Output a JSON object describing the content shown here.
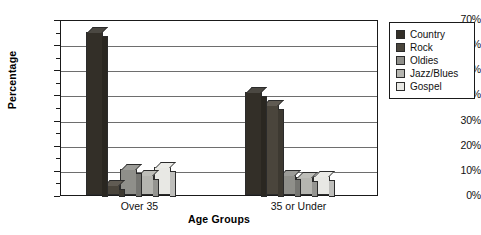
{
  "chart_data": {
    "type": "bar",
    "title": "",
    "xlabel": "Age Groups",
    "ylabel": "Percentage",
    "categories": [
      "Over 35",
      "35 or Under"
    ],
    "series": [
      {
        "name": "Country",
        "values": [
          65,
          41
        ],
        "color": "#332f28"
      },
      {
        "name": "Rock",
        "values": [
          4,
          36
        ],
        "color": "#4a453c"
      },
      {
        "name": "Oldies",
        "values": [
          10.5,
          8
        ],
        "color": "#8f8f8a"
      },
      {
        "name": "Jazz/Blues",
        "values": [
          8,
          7
        ],
        "color": "#b5b5b0"
      },
      {
        "name": "Gospel",
        "values": [
          11,
          7.5
        ],
        "color": "#e8e8e4"
      }
    ],
    "ylim": [
      0,
      70
    ],
    "ytick_labels": [
      "0%",
      "10%",
      "20%",
      "30%",
      "40%",
      "50%",
      "60%",
      "70%"
    ],
    "ytick_values": [
      0,
      10,
      20,
      30,
      40,
      50,
      60,
      70
    ],
    "yminor_values": [
      5,
      15,
      25,
      35,
      45,
      55,
      65
    ],
    "grid": true,
    "legend_position": "right",
    "legend_entries": [
      "Country",
      "Rock",
      "Oldies",
      "Jazz/Blues",
      "Gospel"
    ],
    "value_suffix": "%"
  }
}
